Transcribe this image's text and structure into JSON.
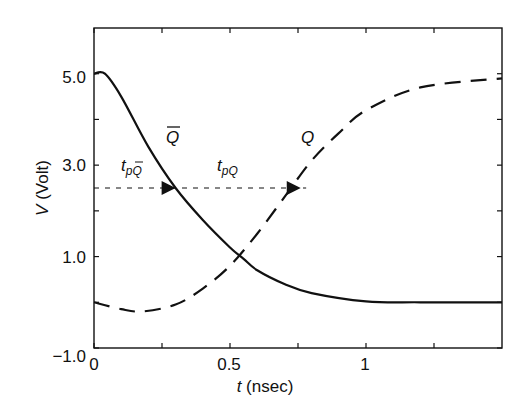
{
  "chart_data": {
    "type": "line",
    "title": "",
    "xlabel": "t (nsec)",
    "xlabel_var": "t",
    "xlabel_unit": "(nsec)",
    "ylabel": "V (Volt)",
    "ylabel_var": "V",
    "ylabel_unit": "(Volt)",
    "xlim": [
      0,
      1.5
    ],
    "ylim": [
      -1.0,
      6.0
    ],
    "x_ticks": [
      0,
      0.5,
      1
    ],
    "x_tick_labels": [
      "0",
      "0.5",
      "1"
    ],
    "y_ticks": [
      -1.0,
      1.0,
      3.0,
      5.0
    ],
    "y_tick_labels": [
      "−1.0",
      "1.0",
      "3.0",
      "5.0"
    ],
    "grid": false,
    "legend": "none (curves labeled inline)",
    "series": [
      {
        "name": "Q̄ (Q-bar)",
        "style": "solid",
        "x": [
          0,
          0.04,
          0.1,
          0.2,
          0.3,
          0.4,
          0.5,
          0.55,
          0.6,
          0.7,
          0.8,
          1.0,
          1.2,
          1.5
        ],
        "y": [
          5.0,
          5.0,
          4.5,
          3.4,
          2.5,
          1.8,
          1.2,
          0.95,
          0.7,
          0.4,
          0.2,
          0.02,
          0.0,
          0.0
        ]
      },
      {
        "name": "Q",
        "style": "dashed",
        "x": [
          0,
          0.1,
          0.18,
          0.3,
          0.4,
          0.5,
          0.6,
          0.7,
          0.8,
          0.9,
          1.0,
          1.2,
          1.5
        ],
        "y": [
          0.0,
          -0.15,
          -0.2,
          -0.05,
          0.3,
          0.8,
          1.5,
          2.3,
          3.1,
          3.7,
          4.2,
          4.7,
          4.9
        ]
      }
    ],
    "annotations": [
      {
        "text": "Q̄",
        "label": "Q",
        "overline": true,
        "x": 0.3,
        "y": 3.8
      },
      {
        "text": "Q",
        "label": "Q",
        "overline": false,
        "x": 0.78,
        "y": 3.8
      },
      {
        "text": "t_pQ̄",
        "main": "t",
        "sub": "pQ",
        "sub_overline": true,
        "x": 0.1,
        "y": 2.9
      },
      {
        "text": "t_pQ",
        "main": "t",
        "sub": "pQ",
        "sub_overline": false,
        "x": 0.5,
        "y": 2.9
      }
    ],
    "reference_line": {
      "style": "dotted",
      "y": 2.5,
      "x_start": 0,
      "x_end": 0.78,
      "arrows_at": [
        0.3,
        0.76
      ]
    }
  }
}
